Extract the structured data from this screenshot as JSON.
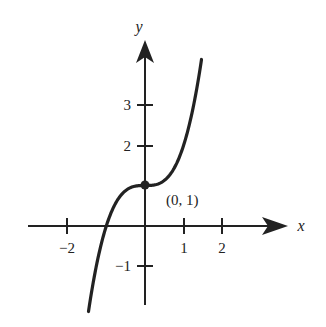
{
  "chart_data": {
    "type": "line",
    "title": "",
    "function": "y = x^3 + 1",
    "xlabel": "x",
    "ylabel": "y",
    "xlim": [
      -2.0,
      3.0
    ],
    "ylim": [
      -2.0,
      4.5
    ],
    "x_ticks": [
      -2,
      1,
      2
    ],
    "x_tick_labels": [
      "−2",
      "1",
      "2"
    ],
    "y_ticks": [
      3,
      2,
      -1
    ],
    "y_tick_labels": [
      "3",
      "2",
      "−1"
    ],
    "grid": false,
    "series": [
      {
        "name": "curve",
        "x": [
          -1.44,
          -1.2,
          -1.0,
          -0.8,
          -0.6,
          -0.4,
          -0.2,
          0,
          0.2,
          0.4,
          0.6,
          0.8,
          1.0,
          1.2,
          1.44
        ],
        "values": [
          -1.99,
          -0.73,
          0,
          0.49,
          0.78,
          0.94,
          0.99,
          1,
          1.01,
          1.06,
          1.22,
          1.51,
          2,
          2.73,
          3.99
        ]
      }
    ],
    "annotations": [
      {
        "point": [
          0,
          1
        ],
        "label": "(0, 1)",
        "marker": "filled-dot"
      }
    ]
  },
  "labels": {
    "x_axis": "x",
    "y_axis": "y",
    "point": "(0, 1)",
    "tick_x_neg2": "−2",
    "tick_x_1": "1",
    "tick_x_2": "2",
    "tick_y_3": "3",
    "tick_y_2": "2",
    "tick_y_neg1": "−1"
  }
}
